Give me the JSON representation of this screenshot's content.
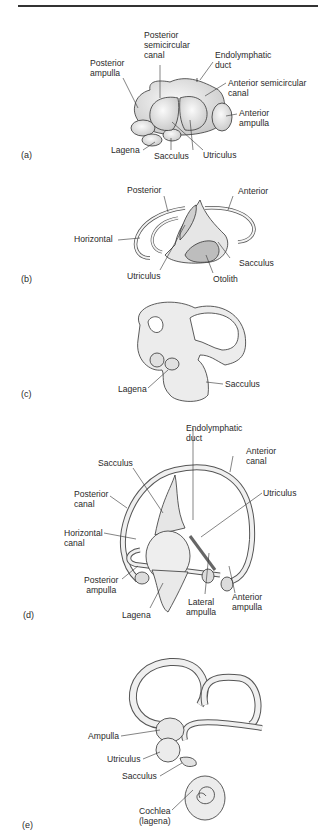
{
  "figure": {
    "panels": [
      {
        "id": "a",
        "label": "(a)",
        "annotations": {
          "posterior_semicircular_canal": "Posterior semicircular canal",
          "posterior_semicircular_canal_l1": "Posterior",
          "posterior_semicircular_canal_l2": "semicircular",
          "posterior_semicircular_canal_l3": "canal",
          "posterior_ampulla_l1": "Posterior",
          "posterior_ampulla_l2": "ampulla",
          "endolymphatic_duct_l1": "Endolymphatic",
          "endolymphatic_duct_l2": "duct",
          "anterior_semicircular_canal_l1": "Anterior semicircular",
          "anterior_semicircular_canal_l2": "canal",
          "anterior_ampulla_l1": "Anterior",
          "anterior_ampulla_l2": "ampulla",
          "lagena": "Lagena",
          "sacculus": "Sacculus",
          "utriculus": "Utriculus"
        }
      },
      {
        "id": "b",
        "label": "(b)",
        "annotations": {
          "posterior": "Posterior",
          "anterior": "Anterior",
          "horizontal": "Horizontal",
          "sacculus": "Sacculus",
          "utriculus": "Utriculus",
          "otolith": "Otolith"
        }
      },
      {
        "id": "c",
        "label": "(c)",
        "annotations": {
          "lagena": "Lagena",
          "sacculus": "Sacculus"
        }
      },
      {
        "id": "d",
        "label": "(d)",
        "annotations": {
          "endolymphatic_duct_l1": "Endolymphatic",
          "endolymphatic_duct_l2": "duct",
          "anterior_canal_l1": "Anterior",
          "anterior_canal_l2": "canal",
          "sacculus": "Sacculus",
          "posterior_canal_l1": "Posterior",
          "posterior_canal_l2": "canal",
          "utriculus": "Utriculus",
          "horizontal_canal_l1": "Horizontal",
          "horizontal_canal_l2": "canal",
          "posterior_ampulla_l1": "Posterior",
          "posterior_ampulla_l2": "ampulla",
          "lagena": "Lagena",
          "lateral_ampulla_l1": "Lateral",
          "lateral_ampulla_l2": "ampulla",
          "anterior_ampulla_l1": "Anterior",
          "anterior_ampulla_l2": "ampulla"
        }
      },
      {
        "id": "e",
        "label": "(e)",
        "annotations": {
          "ampulla": "Ampulla",
          "utriculus": "Utriculus",
          "sacculus": "Sacculus",
          "cochlea_l1": "Cochlea",
          "cochlea_l2": "(lagena)"
        }
      }
    ],
    "colors": {
      "line": "#333333",
      "fill": "#eeeeee",
      "shade": "#bdbdbd",
      "text": "#2a2a2a"
    }
  }
}
